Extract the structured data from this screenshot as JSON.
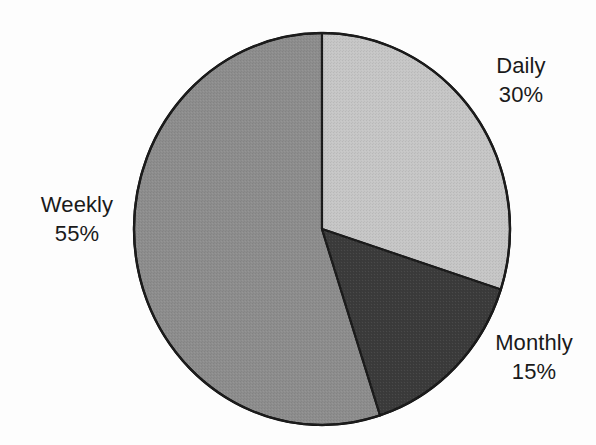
{
  "chart_data": {
    "type": "pie",
    "title": "",
    "xlabel": "",
    "ylabel": "",
    "categories": [
      "Daily",
      "Monthly",
      "Weekly"
    ],
    "values": [
      30,
      15,
      55
    ],
    "unit": "%",
    "legend": "none",
    "grid": false,
    "start_angle_deg": 0,
    "direction": "clockwise",
    "labels_position": "outside",
    "slices": [
      {
        "name": "Daily",
        "value": 30,
        "value_label": "30%",
        "color": "#c6c6c6",
        "start_deg": 0,
        "end_deg": 108
      },
      {
        "name": "Monthly",
        "value": 15,
        "value_label": "15%",
        "color": "#3b3b3b",
        "start_deg": 108,
        "end_deg": 162
      },
      {
        "name": "Weekly",
        "value": 55,
        "value_label": "55%",
        "color": "#8d8d8d",
        "start_deg": 162,
        "end_deg": 360
      }
    ]
  },
  "figure": {
    "background_color": "#fdfdfd",
    "outline_color": "#1a1a1a"
  },
  "labels": {
    "daily": {
      "name": "Daily",
      "value": "30%"
    },
    "weekly": {
      "name": "Weekly",
      "value": "55%"
    },
    "monthly": {
      "name": "Monthly",
      "value": "15%"
    }
  }
}
